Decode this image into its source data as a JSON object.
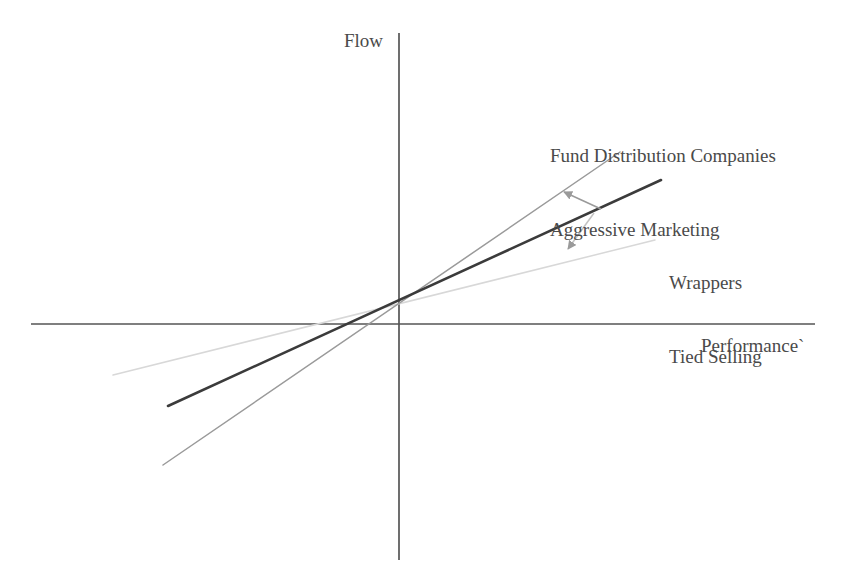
{
  "figure": {
    "background_color": "#ffffff",
    "width": 843,
    "height": 582
  },
  "axes": {
    "y_label": "Flow",
    "x_label": "Performance`",
    "axis_color": "#555555"
  },
  "annotations": {
    "steep": {
      "line1": "Fund Distribution Companies",
      "line2": "Aggressive Marketing",
      "target_series": "Fund Distribution Companies / Aggressive Marketing"
    },
    "flat": {
      "line1": "Wrappers",
      "line2": "Tied Selling",
      "target_series": "Wrappers / Tied Selling"
    }
  },
  "colors": {
    "baseline_line": "#3b3b3b",
    "steep_line": "#9a9a9a",
    "flat_line": "#d8d8d8",
    "arrow": "#9a9a9a",
    "axis": "#555555",
    "text": "#4a4a4a"
  },
  "chart_data": {
    "type": "line",
    "title": "",
    "subtitle": "",
    "xlabel": "Performance`",
    "ylabel": "Flow",
    "grid": false,
    "legend": "none",
    "axis_style": "cartesian-cross-through-origin",
    "xlim": [
      -1,
      1
    ],
    "ylim": [
      -1,
      1
    ],
    "origin_px": [
      399,
      324
    ],
    "series": [
      {
        "name": "Baseline flow-performance relationship",
        "color": "#3b3b3b",
        "style": "solid",
        "width": 2.6,
        "slope_relative": 1.0,
        "labelled": false,
        "points_px": [
          [
            168,
            406
          ],
          [
            661,
            180
          ]
        ],
        "x": [
          -0.62,
          0.56
        ],
        "y": [
          -0.18,
          0.31
        ]
      },
      {
        "name": "Fund Distribution Companies / Aggressive Marketing",
        "color": "#9a9a9a",
        "style": "solid",
        "width": 1.5,
        "slope_relative": 1.75,
        "labelled": true,
        "points_px": [
          [
            163,
            465
          ],
          [
            620,
            152
          ]
        ],
        "x": [
          -0.63,
          0.48
        ],
        "y": [
          -0.33,
          0.39
        ]
      },
      {
        "name": "Wrappers / Tied Selling",
        "color": "#d8d8d8",
        "style": "solid",
        "width": 1.5,
        "slope_relative": 0.52,
        "labelled": true,
        "points_px": [
          [
            113,
            375
          ],
          [
            655,
            240
          ]
        ],
        "x": [
          -0.75,
          0.55
        ],
        "y": [
          -0.12,
          0.2
        ]
      }
    ],
    "arrows": [
      {
        "name": "arrow-to-steep-line",
        "from_px": [
          601,
          209
        ],
        "to_px": [
          564,
          192
        ],
        "direction": "up-left",
        "points_to": "Fund Distribution Companies / Aggressive Marketing"
      },
      {
        "name": "arrow-to-flat-line",
        "from_px": [
          594,
          213
        ],
        "to_px": [
          568,
          249
        ],
        "direction": "down",
        "points_to": "Wrappers / Tied Selling"
      }
    ],
    "annotations": [
      {
        "text": "Fund Distribution Companies Aggressive Marketing",
        "position_px": [
          550,
          95
        ]
      },
      {
        "text": "Wrappers Tied Selling",
        "position_px": [
          669,
          222
        ]
      }
    ]
  }
}
